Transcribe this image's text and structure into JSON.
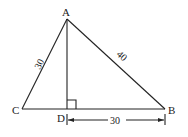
{
  "diagram": {
    "type": "geometry-triangle",
    "points": {
      "A": {
        "label": "A",
        "x": 67,
        "y": 19
      },
      "B": {
        "label": "B",
        "x": 165,
        "y": 109
      },
      "C": {
        "label": "C",
        "x": 22,
        "y": 109
      },
      "D": {
        "label": "D",
        "x": 67,
        "y": 109
      }
    },
    "segments": [
      {
        "from": "A",
        "to": "C",
        "length_label": "30"
      },
      {
        "from": "A",
        "to": "B",
        "length_label": "40"
      },
      {
        "from": "C",
        "to": "B",
        "length_label": ""
      },
      {
        "from": "A",
        "to": "D",
        "length_label": ""
      }
    ],
    "right_angle_at": "D",
    "dimension": {
      "from": "D",
      "to": "B",
      "label": "30"
    },
    "labels": {
      "A": "A",
      "B": "B",
      "C": "C",
      "D": "D",
      "AC": "30",
      "AB": "40",
      "DB": "30"
    },
    "colors": {
      "line": "#222222",
      "background": "#ffffff"
    }
  }
}
